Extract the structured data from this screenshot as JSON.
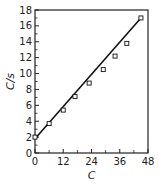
{
  "chart_data": {
    "type": "line",
    "title": "",
    "xlabel": "C",
    "ylabel": "C/s",
    "xlim": [
      0,
      48
    ],
    "ylim": [
      0,
      18
    ],
    "xticks": [
      "0",
      "12",
      "24",
      "36",
      "48"
    ],
    "yticks": [
      "0",
      "2",
      "4",
      "6",
      "8",
      "10",
      "12",
      "14",
      "16",
      "18"
    ],
    "grid": false,
    "series": [
      {
        "name": "data",
        "marker": "square-open",
        "x": [
          0,
          6,
          12,
          17,
          23,
          29,
          34,
          39,
          45
        ],
        "y": [
          2.0,
          3.7,
          5.4,
          7.1,
          8.8,
          10.5,
          12.2,
          13.8,
          17.0
        ]
      }
    ],
    "fit_line": {
      "x": [
        0,
        45
      ],
      "y": [
        1.8,
        17.0
      ]
    }
  }
}
